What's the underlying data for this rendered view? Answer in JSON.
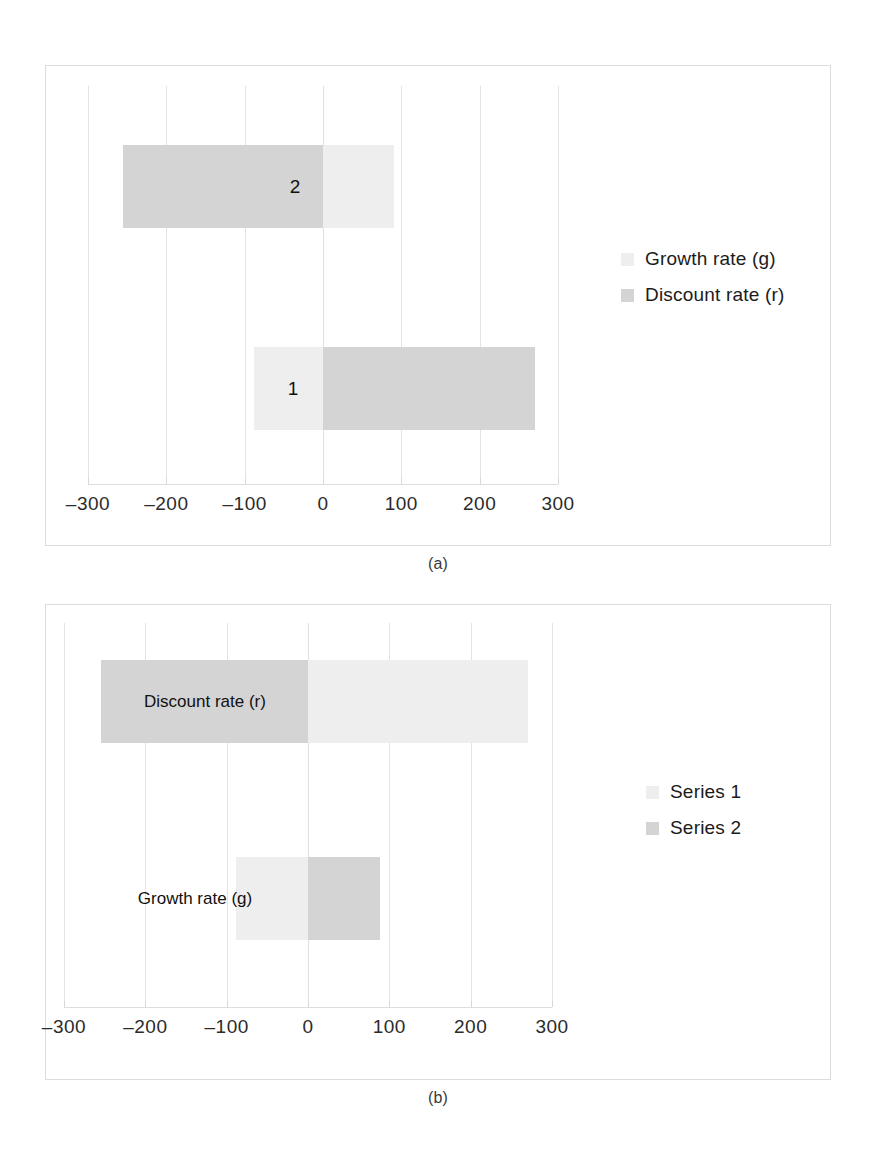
{
  "figure": {
    "background": "#ffffff",
    "panel_border_color": "#dcdcdc"
  },
  "panels": [
    {
      "id": "a",
      "caption": "(a)",
      "legend": {
        "position": "right",
        "entries": [
          {
            "label": "Growth rate (g)",
            "color": "#eeeeee"
          },
          {
            "label": "Discount rate (r)",
            "color": "#d4d4d4"
          }
        ]
      }
    },
    {
      "id": "b",
      "caption": "(b)",
      "legend": {
        "position": "right",
        "entries": [
          {
            "label": "Series 1",
            "color": "#eeeeee"
          },
          {
            "label": "Series 2",
            "color": "#d4d4d4"
          }
        ]
      }
    }
  ],
  "chart_data": [
    {
      "type": "bar",
      "orientation": "horizontal",
      "stacked": true,
      "title": "",
      "subtitle": "(a)",
      "xlabel": "",
      "ylabel": "",
      "xlim": [
        -300,
        300
      ],
      "xticks": [
        -300,
        -200,
        -100,
        0,
        100,
        200,
        300
      ],
      "xticklabels": [
        "-300",
        "-200",
        "-100",
        "0",
        "100",
        "200",
        "300"
      ],
      "grid": true,
      "legend_position": "right",
      "categories": [
        "1",
        "2"
      ],
      "category_label_position": "inside-bar",
      "series": [
        {
          "name": "Growth rate (g)",
          "color": "#eeeeee",
          "segments": [
            {
              "category": "1",
              "start": -88,
              "end": 0
            },
            {
              "category": "2",
              "start": 0,
              "end": 90
            }
          ]
        },
        {
          "name": "Discount rate (r)",
          "color": "#d4d4d4",
          "segments": [
            {
              "category": "1",
              "start": 0,
              "end": 270
            },
            {
              "category": "2",
              "start": -255,
              "end": 0
            }
          ]
        }
      ]
    },
    {
      "type": "bar",
      "orientation": "horizontal",
      "stacked": true,
      "title": "",
      "subtitle": "(b)",
      "xlabel": "",
      "ylabel": "",
      "xlim": [
        -300,
        300
      ],
      "xticks": [
        -300,
        -200,
        -100,
        0,
        100,
        200,
        300
      ],
      "xticklabels": [
        "-300",
        "-200",
        "-100",
        "0",
        "100",
        "200",
        "300"
      ],
      "grid": true,
      "legend_position": "right",
      "categories": [
        "Growth rate (g)",
        "Discount rate (r)"
      ],
      "category_label_position": "inside-bar",
      "series": [
        {
          "name": "Series 1",
          "color": "#eeeeee",
          "segments": [
            {
              "category": "Growth rate (g)",
              "start": -88,
              "end": 0
            },
            {
              "category": "Discount rate (r)",
              "start": 0,
              "end": 270
            }
          ]
        },
        {
          "name": "Series 2",
          "color": "#d4d4d4",
          "segments": [
            {
              "category": "Growth rate (g)",
              "start": 0,
              "end": 88
            },
            {
              "category": "Discount rate (r)",
              "start": -255,
              "end": 0
            }
          ]
        }
      ]
    }
  ],
  "panel_a": {
    "caption": "(a)",
    "ticks": [
      {
        "value": -300,
        "label": "-300"
      },
      {
        "value": -200,
        "label": "-200"
      },
      {
        "value": -100,
        "label": "-100"
      },
      {
        "value": 0,
        "label": "0"
      },
      {
        "value": 100,
        "label": "100"
      },
      {
        "value": 200,
        "label": "200"
      },
      {
        "value": 300,
        "label": "300"
      }
    ],
    "bars": [
      {
        "row": "2",
        "label": "2",
        "segments": [
          {
            "series": "Discount rate (r)",
            "start": -255,
            "end": 0,
            "color": "#d4d4d4"
          },
          {
            "series": "Growth rate (g)",
            "start": 0,
            "end": 90,
            "color": "#eeeeee"
          }
        ]
      },
      {
        "row": "1",
        "label": "1",
        "segments": [
          {
            "series": "Growth rate (g)",
            "start": -88,
            "end": 0,
            "color": "#eeeeee"
          },
          {
            "series": "Discount rate (r)",
            "start": 0,
            "end": 270,
            "color": "#d4d4d4"
          }
        ]
      }
    ],
    "legend": [
      {
        "label": "Growth rate (g)",
        "color": "#eeeeee"
      },
      {
        "label": "Discount rate (r)",
        "color": "#d4d4d4"
      }
    ]
  },
  "panel_b": {
    "caption": "(b)",
    "ticks": [
      {
        "value": -300,
        "label": "-300"
      },
      {
        "value": -200,
        "label": "-200"
      },
      {
        "value": -100,
        "label": "-100"
      },
      {
        "value": 0,
        "label": "0"
      },
      {
        "value": 100,
        "label": "100"
      },
      {
        "value": 200,
        "label": "200"
      },
      {
        "value": 300,
        "label": "300"
      }
    ],
    "bars": [
      {
        "row": "Discount rate (r)",
        "label": "Discount rate (r)",
        "segments": [
          {
            "series": "Series 2",
            "start": -255,
            "end": 0,
            "color": "#d4d4d4"
          },
          {
            "series": "Series 1",
            "start": 0,
            "end": 270,
            "color": "#eeeeee"
          }
        ]
      },
      {
        "row": "Growth rate (g)",
        "label": "Growth rate (g)",
        "segments": [
          {
            "series": "Series 1",
            "start": -88,
            "end": 0,
            "color": "#eeeeee"
          },
          {
            "series": "Series 2",
            "start": 0,
            "end": 88,
            "color": "#d4d4d4"
          }
        ]
      }
    ],
    "legend": [
      {
        "label": "Series 1",
        "color": "#eeeeee"
      },
      {
        "label": "Series 2",
        "color": "#d4d4d4"
      }
    ]
  }
}
